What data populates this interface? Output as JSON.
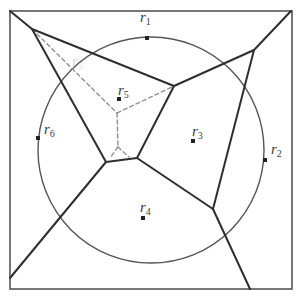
{
  "diagram": {
    "type": "voronoi-with-circle",
    "frame": {
      "x": 10,
      "y": 11,
      "width": 282,
      "height": 278
    },
    "circle": {
      "cx": 151,
      "cy": 150,
      "r": 113
    },
    "colors": {
      "solid": "#2e2e2e",
      "dashed": "#8a8a8a",
      "circle": "#555555",
      "frame": "#555555"
    },
    "points": [
      {
        "id": "r1",
        "label": "r",
        "sub": "1",
        "x": 147,
        "y": 38,
        "lx": 140,
        "ly": 22
      },
      {
        "id": "r2",
        "label": "r",
        "sub": "2",
        "x": 265,
        "y": 160,
        "lx": 271,
        "ly": 154
      },
      {
        "id": "r3",
        "label": "r",
        "sub": "3",
        "x": 193,
        "y": 141,
        "lx": 192,
        "ly": 136
      },
      {
        "id": "r4",
        "label": "r",
        "sub": "4",
        "x": 143,
        "y": 218,
        "lx": 140,
        "ly": 212
      },
      {
        "id": "r5",
        "label": "r",
        "sub": "5",
        "x": 119,
        "y": 99,
        "lx": 118,
        "ly": 95
      },
      {
        "id": "r6",
        "label": "r",
        "sub": "6",
        "x": 38,
        "y": 138,
        "lx": 44,
        "ly": 134
      }
    ],
    "solid_edges": [
      [
        [
          10,
          11
        ],
        [
          32,
          29
        ]
      ],
      [
        [
          32,
          29
        ],
        [
          174,
          86
        ]
      ],
      [
        [
          32,
          29
        ],
        [
          106,
          162
        ]
      ],
      [
        [
          174,
          86
        ],
        [
          254,
          50
        ]
      ],
      [
        [
          254,
          50
        ],
        [
          291,
          11
        ]
      ],
      [
        [
          174,
          86
        ],
        [
          137,
          158
        ]
      ],
      [
        [
          106,
          162
        ],
        [
          137,
          158
        ]
      ],
      [
        [
          106,
          162
        ],
        [
          10,
          278
        ]
      ],
      [
        [
          137,
          158
        ],
        [
          213,
          209
        ]
      ],
      [
        [
          254,
          50
        ],
        [
          213,
          209
        ]
      ],
      [
        [
          213,
          209
        ],
        [
          250,
          289
        ]
      ]
    ],
    "dashed_edges": [
      [
        [
          32,
          29
        ],
        [
          117,
          113
        ]
      ],
      [
        [
          117,
          113
        ],
        [
          174,
          86
        ]
      ],
      [
        [
          117,
          113
        ],
        [
          118,
          147
        ]
      ],
      [
        [
          118,
          147
        ],
        [
          110,
          158
        ]
      ],
      [
        [
          118,
          147
        ],
        [
          129,
          157
        ]
      ]
    ],
    "faded_label": {
      "text": "r",
      "sub": "5",
      "x": 72,
      "y": 66
    }
  }
}
